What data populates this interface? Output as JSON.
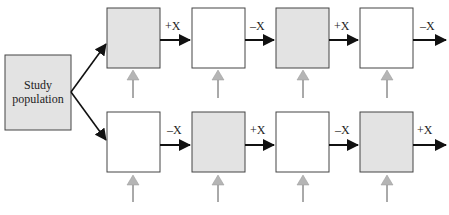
{
  "diagram": {
    "source_box": {
      "label_line1": "Study",
      "label_line2": "population",
      "fill": "#e3e3e3"
    },
    "rows": [
      {
        "name": "top",
        "boxes": [
          {
            "fill": "#e3e3e3",
            "out_label": "+X"
          },
          {
            "fill": "#ffffff",
            "out_label": "–X"
          },
          {
            "fill": "#e3e3e3",
            "out_label": "+X"
          },
          {
            "fill": "#ffffff",
            "out_label": "–X"
          }
        ]
      },
      {
        "name": "bottom",
        "boxes": [
          {
            "fill": "#ffffff",
            "out_label": "–X"
          },
          {
            "fill": "#e3e3e3",
            "out_label": "+X"
          },
          {
            "fill": "#ffffff",
            "out_label": "–X"
          },
          {
            "fill": "#e3e3e3",
            "out_label": "+X"
          }
        ]
      }
    ],
    "colors": {
      "exposed_fill": "#e3e3e3",
      "unexposed_fill": "#ffffff",
      "arrow": "#111111",
      "measure_arrow": "#b5b5b5"
    },
    "caption": ""
  }
}
